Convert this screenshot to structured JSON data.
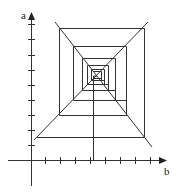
{
  "diagram": {
    "type": "cobweb-diagram",
    "axes": {
      "y_label": "a",
      "x_label": "b",
      "color": "#333333"
    },
    "line_color": "#333333",
    "x_ticks": [
      45,
      60,
      75,
      90,
      105,
      120,
      135,
      150
    ],
    "y_ticks": [
      24,
      39,
      55,
      70,
      85,
      100,
      115,
      130,
      145
    ]
  }
}
